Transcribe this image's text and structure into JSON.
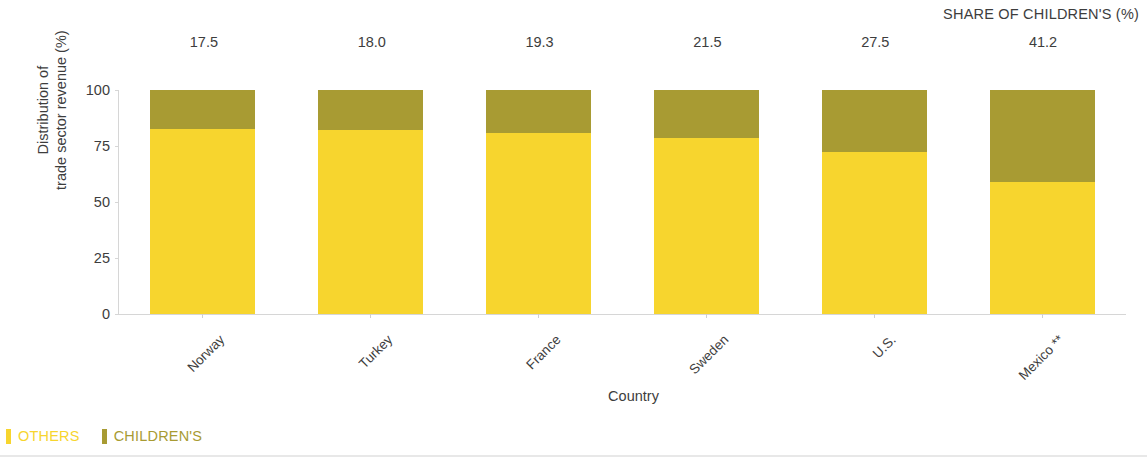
{
  "header": {
    "share_title": "SHARE OF CHILDREN'S (%)"
  },
  "axes": {
    "ylabel": "Distribution of\ntrade sector revenue (%)",
    "xlabel": "Country",
    "yticks": [
      "0",
      "25",
      "50",
      "75",
      "100"
    ]
  },
  "legend": {
    "items": [
      {
        "label": "OTHERS",
        "color": "#F7D52E"
      },
      {
        "label": "CHILDREN'S",
        "color": "#A89B33"
      }
    ]
  },
  "colors": {
    "others": "#F7D52E",
    "childrens": "#A89B33",
    "axis": "#d6d6d6",
    "text": "#3d3d3d"
  },
  "chart_data": {
    "type": "bar",
    "title": "",
    "subtitle": "",
    "xlabel": "Country",
    "ylabel": "Distribution of trade sector revenue (%)",
    "ylim": [
      0,
      100
    ],
    "yticks": [
      0,
      25,
      50,
      75,
      100
    ],
    "grid": false,
    "stacked": true,
    "legend_position": "bottom-left",
    "annotation_header": "SHARE OF CHILDREN'S (%)",
    "categories": [
      "Norway",
      "Turkey",
      "France",
      "Sweden",
      "U.S.",
      "Mexico **"
    ],
    "data_labels": [
      "17.5",
      "18.0",
      "19.3",
      "21.5",
      "27.5",
      "41.2"
    ],
    "series": [
      {
        "name": "OTHERS",
        "color": "#F7D52E",
        "values": [
          82.5,
          82.0,
          80.7,
          78.5,
          72.5,
          58.8
        ]
      },
      {
        "name": "CHILDREN'S",
        "color": "#A89B33",
        "values": [
          17.5,
          18.0,
          19.3,
          21.5,
          27.5,
          41.2
        ]
      }
    ]
  }
}
